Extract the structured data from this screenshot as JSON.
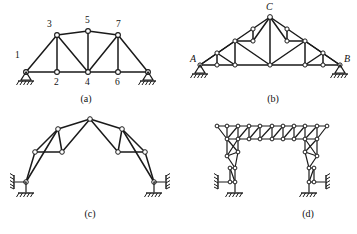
{
  "figure": {
    "subfigures": [
      {
        "caption": "(a)",
        "type": "pratt-truss-with-inclined-end-posts",
        "node_labels": [
          "1",
          "2",
          "3",
          "4",
          "5",
          "6",
          "7"
        ],
        "supports": [
          "pin-left",
          "roller-right"
        ]
      },
      {
        "caption": "(b)",
        "type": "fink-roof-truss",
        "node_labels": [
          "A",
          "B",
          "C"
        ],
        "supports": [
          "pin-left",
          "roller-right"
        ]
      },
      {
        "caption": "(c)",
        "type": "three-hinged-gable-frame",
        "node_labels": [],
        "supports": [
          "wall-link-left",
          "ground-left",
          "wall-link-right",
          "ground-right"
        ]
      },
      {
        "caption": "(d)",
        "type": "latticed-portal-frame",
        "node_labels": [],
        "supports": [
          "ground-left",
          "wall-link-left",
          "ground-right",
          "wall-link-right"
        ]
      }
    ]
  },
  "captions": {
    "a": "(a)",
    "b": "(b)",
    "c": "(c)",
    "d": "(d)"
  },
  "labels_a": {
    "n1": "1",
    "n2": "2",
    "n3": "3",
    "n4": "4",
    "n5": "5",
    "n6": "6",
    "n7": "7"
  },
  "labels_b": {
    "A": "A",
    "B": "B",
    "C": "C"
  },
  "colors": {
    "line": "#1a1a1a",
    "node_fill": "#ffffff",
    "background": "#ffffff"
  }
}
